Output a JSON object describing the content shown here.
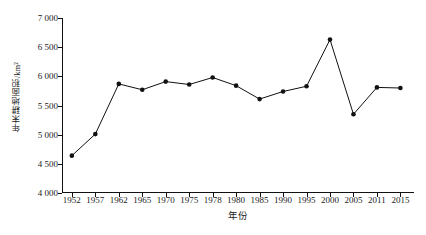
{
  "chart_data": {
    "type": "line",
    "title": "",
    "xlabel": "年份",
    "ylabel": "年末耕地面积/km²",
    "categories": [
      "1952",
      "1957",
      "1962",
      "1965",
      "1970",
      "1975",
      "1978",
      "1980",
      "1985",
      "1990",
      "1995",
      "2000",
      "2005",
      "2011",
      "2015"
    ],
    "values": [
      4640,
      5010,
      5870,
      5770,
      5910,
      5860,
      5980,
      5840,
      5610,
      5740,
      5830,
      6630,
      5350,
      5810,
      5800
    ],
    "series": [
      {
        "name": "年末耕地面积",
        "values": [
          4640,
          5010,
          5870,
          5770,
          5910,
          5860,
          5980,
          5840,
          5610,
          5740,
          5830,
          6630,
          5350,
          5810,
          5800
        ]
      }
    ],
    "ylim": [
      4000,
      7000
    ],
    "ytick_values": [
      4000,
      4500,
      5000,
      5500,
      6000,
      6500,
      7000
    ],
    "ytick_labels": [
      "4 000",
      "4 500",
      "5 000",
      "5 500",
      "6 000",
      "6 500",
      "7 000"
    ],
    "grid": false,
    "legend": false,
    "legend_position": "none",
    "line_color": "#111111",
    "marker_color": "#111111",
    "marker": "circle",
    "background_color": "#ffffff",
    "axis_color": "#111111"
  }
}
